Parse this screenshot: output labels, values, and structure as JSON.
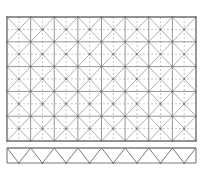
{
  "diagram": {
    "type": "space-frame-grid",
    "plan": {
      "x": 7,
      "y": 17,
      "width": 189,
      "height": 124,
      "columns": 8,
      "rows": 5,
      "solid_color": "#8a8a8a",
      "frame_color": "#6e6e6e",
      "dash_color": "#a0a0a0",
      "diag_color": "#9a9a9a",
      "node_color": "#777777"
    },
    "truss": {
      "x": 7,
      "y": 148,
      "width": 189,
      "height": 15,
      "panels": 8,
      "color": "#7a7a7a"
    }
  }
}
